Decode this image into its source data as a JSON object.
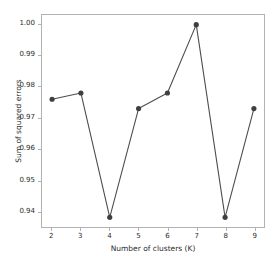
{
  "chart_data": {
    "type": "line",
    "title": "",
    "xlabel": "Number of clusters (K)",
    "ylabel": "Sum of squared errors",
    "x": [
      2,
      3,
      4,
      5,
      6,
      7,
      8,
      9
    ],
    "values": [
      0.976,
      0.978,
      0.938,
      0.973,
      0.978,
      1.0,
      0.938,
      0.973
    ],
    "categories": [
      "2",
      "3",
      "4",
      "5",
      "6",
      "7",
      "8",
      "9"
    ],
    "xtick_labels": [
      "2",
      "3",
      "4",
      "5",
      "6",
      "7",
      "8",
      "9"
    ],
    "ytick_labels": [
      "0.94",
      "0.95",
      "0.96",
      "0.97",
      "0.98",
      "0.99",
      "1.00"
    ],
    "ytick_values": [
      0.94,
      0.95,
      0.96,
      0.97,
      0.98,
      0.99,
      1.0
    ],
    "xlim": [
      1.65,
      9.35
    ],
    "ylim": [
      0.9349,
      1.0031
    ],
    "grid": false,
    "legend": null,
    "marker": "circle",
    "line_color": "#4d4d4d",
    "marker_color": "#3f3f3f",
    "axis_color": "#b2b2b2",
    "background_color": "#ffffff",
    "series": [
      {
        "name": "Sum of squared errors",
        "values": [
          0.976,
          0.978,
          0.938,
          0.973,
          0.978,
          1.0,
          0.938,
          0.973
        ]
      }
    ]
  }
}
